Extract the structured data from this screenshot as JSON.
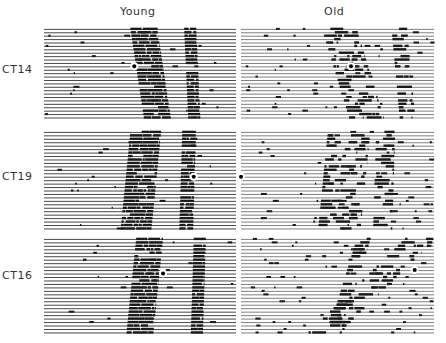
{
  "figure": {
    "caption_fragment": "",
    "columns": [
      "Young",
      "Old"
    ],
    "rows": [
      {
        "label": "CT14",
        "young": {
          "days": 27,
          "onset_start": 0.45,
          "onset_end": 0.52,
          "width": 0.14,
          "second_band": 0.73,
          "density": 0.95,
          "pulse_day": 11,
          "pulse_phase": 0.47
        },
        "old": {
          "days": 27,
          "onset_start": 0.42,
          "onset_end": 0.56,
          "width": 0.18,
          "second_band": 0.78,
          "density": 0.55,
          "pulse_day": 11,
          "pulse_phase": 0.57
        }
      },
      {
        "label": "CT19",
        "young": {
          "days": 29,
          "onset_start": 0.45,
          "onset_end": 0.4,
          "width": 0.16,
          "second_band": 0.72,
          "density": 0.95,
          "pulse_day": 13,
          "pulse_phase": 0.78
        },
        "old": {
          "days": 29,
          "onset_start": 0.45,
          "onset_end": 0.4,
          "width": 0.22,
          "second_band": 0.7,
          "density": 0.5,
          "pulse_day": 13,
          "pulse_phase": 0.0
        }
      },
      {
        "label": "CT16",
        "young": {
          "days": 28,
          "onset_start": 0.48,
          "onset_end": 0.43,
          "width": 0.14,
          "second_band": 0.78,
          "density": 0.95,
          "pulse_day": 10,
          "pulse_phase": 0.62
        },
        "old": {
          "days": 28,
          "onset_start": 0.85,
          "onset_end": 0.35,
          "width": 0.16,
          "second_band": 0.6,
          "density": 0.5,
          "pulse_day": 9,
          "pulse_phase": 0.9
        }
      }
    ],
    "colors": {
      "ink": "#1a1a1a",
      "background": "#ffffff",
      "pulse_marker": "#000000"
    }
  }
}
